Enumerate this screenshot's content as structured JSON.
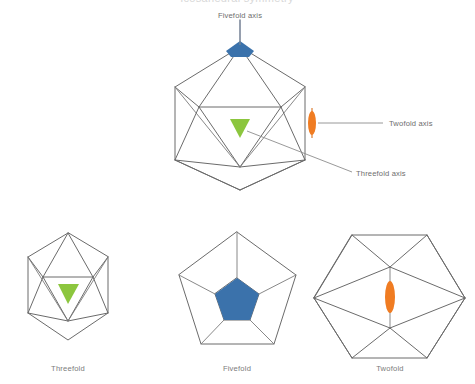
{
  "figure": {
    "title_partial": "Icosahedral symmetry",
    "background_color": "#ffffff",
    "edge_color": "#6b6b6b",
    "label_color": "#6e6e6e"
  },
  "main_diagram": {
    "name": "icosahedron-with-symmetry-axes",
    "callouts": [
      {
        "id": "fivefold",
        "label": "Fivefold axis",
        "axis_color": "#3b72ab",
        "marker_shape": "pentagon",
        "position": "top-vertex"
      },
      {
        "id": "twofold",
        "label": "Twofold axis",
        "axis_color": "#f07c22",
        "marker_shape": "lens-ellipse",
        "position": "right-edge-midpoint"
      },
      {
        "id": "threefold",
        "label": "Threefold axis",
        "axis_color": "#8cc63e",
        "marker_shape": "triangle",
        "position": "front-face-center"
      }
    ]
  },
  "views": [
    {
      "id": "threefold-view",
      "caption": "Threefold",
      "outline": "hexagonal-icosahedron-projection",
      "marker_shape": "triangle",
      "marker_color": "#8cc63e"
    },
    {
      "id": "fivefold-view",
      "caption": "Fivefold",
      "outline": "pentagon",
      "marker_shape": "pentagon",
      "marker_color": "#3b72ab"
    },
    {
      "id": "twofold-view",
      "caption": "Twofold",
      "outline": "hexagon",
      "marker_shape": "lens-ellipse",
      "marker_color": "#f07c22"
    }
  ]
}
